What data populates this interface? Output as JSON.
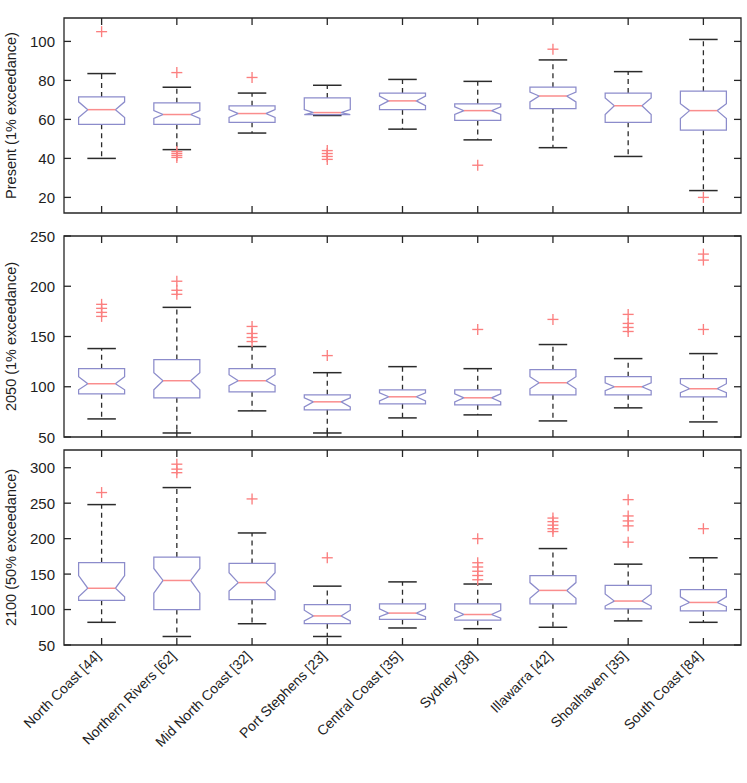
{
  "figure": {
    "title": "",
    "background": "#ffffff",
    "box_edge_color": "#8c8ccb",
    "median_color": "#fa8d8d",
    "whisker_color": "#2b2b2b",
    "outlier_color": "#fb7f7f"
  },
  "xaxis": {
    "categories": [
      "North Coast [44]",
      "Northern Rivers [62]",
      "Mid North Coast [32]",
      "Port Stephens [23]",
      "Central Coast [35]",
      "Sydney [38]",
      "Illawarra [42]",
      "Shoalhaven [35]",
      "South Coast [84]"
    ],
    "label_rotation": -45
  },
  "chart_data": [
    {
      "type": "box",
      "panel": 1,
      "title": "",
      "ylabel": "Present (1% exceedance)",
      "xlabel": "",
      "ylim": [
        12,
        112
      ],
      "yticks": [
        20,
        40,
        60,
        80,
        100
      ],
      "ytick_labels": [
        "20",
        "40",
        "60",
        "80",
        "100"
      ],
      "grid": false,
      "categories": [
        "North Coast [44]",
        "Northern Rivers [62]",
        "Mid North Coast [32]",
        "Port Stephens [23]",
        "Central Coast [35]",
        "Sydney [38]",
        "Illawarra [42]",
        "Shoalhaven [35]",
        "South Coast [84]"
      ],
      "boxes": [
        {
          "category": "North Coast [44]",
          "whisker_low": 40.0,
          "q1": 57.5,
          "median": 65.0,
          "q3": 71.5,
          "whisker_high": 83.5,
          "notch_low": 61.0,
          "notch_high": 69.0,
          "outliers": [
            105.0
          ]
        },
        {
          "category": "Northern Rivers [62]",
          "whisker_low": 44.5,
          "q1": 57.5,
          "median": 62.5,
          "q3": 68.5,
          "whisker_high": 76.5,
          "notch_low": 60.5,
          "notch_high": 64.5,
          "outliers": [
            84.0,
            43.5,
            42.5,
            41.5,
            40.5
          ]
        },
        {
          "category": "Mid North Coast [32]",
          "whisker_low": 53.0,
          "q1": 58.5,
          "median": 63.0,
          "q3": 67.0,
          "whisker_high": 73.5,
          "notch_low": 61.0,
          "notch_high": 65.0,
          "outliers": [
            81.5
          ]
        },
        {
          "category": "Port Stephens [23]",
          "whisker_low": 62.0,
          "q1": 62.5,
          "median": 63.5,
          "q3": 71.0,
          "whisker_high": 77.5,
          "notch_low": 62.5,
          "notch_high": 65.0,
          "outliers": [
            44.0,
            42.5,
            41.0,
            39.5
          ]
        },
        {
          "category": "Central Coast [35]",
          "whisker_low": 55.0,
          "q1": 65.0,
          "median": 69.5,
          "q3": 73.5,
          "whisker_high": 80.5,
          "notch_low": 67.0,
          "notch_high": 72.0,
          "outliers": []
        },
        {
          "category": "Sydney [38]",
          "whisker_low": 49.5,
          "q1": 59.5,
          "median": 64.5,
          "q3": 68.0,
          "whisker_high": 79.5,
          "notch_low": 62.5,
          "notch_high": 66.5,
          "outliers": [
            36.5
          ]
        },
        {
          "category": "Illawarra [42]",
          "whisker_low": 45.5,
          "q1": 65.5,
          "median": 72.0,
          "q3": 76.5,
          "whisker_high": 90.5,
          "notch_low": 69.0,
          "notch_high": 74.0,
          "outliers": [
            96.0
          ]
        },
        {
          "category": "Shoalhaven [35]",
          "whisker_low": 41.0,
          "q1": 58.5,
          "median": 67.0,
          "q3": 73.5,
          "whisker_high": 84.5,
          "notch_low": 62.5,
          "notch_high": 71.0,
          "outliers": []
        },
        {
          "category": "South Coast [84]",
          "whisker_low": 23.5,
          "q1": 54.5,
          "median": 64.5,
          "q3": 74.5,
          "whisker_high": 101.0,
          "notch_low": 60.5,
          "notch_high": 68.0,
          "outliers": [
            20.0
          ]
        }
      ]
    },
    {
      "type": "box",
      "panel": 2,
      "title": "",
      "ylabel": "2050 (1% exceedance)",
      "xlabel": "",
      "ylim": [
        50,
        250
      ],
      "yticks": [
        50,
        100,
        150,
        200,
        250
      ],
      "ytick_labels": [
        "50",
        "100",
        "150",
        "200",
        "250"
      ],
      "grid": false,
      "categories": [
        "North Coast [44]",
        "Northern Rivers [62]",
        "Mid North Coast [32]",
        "Port Stephens [23]",
        "Central Coast [35]",
        "Sydney [38]",
        "Illawarra [42]",
        "Shoalhaven [35]",
        "South Coast [84]"
      ],
      "boxes": [
        {
          "category": "North Coast [44]",
          "whisker_low": 68.0,
          "q1": 93.0,
          "median": 103.0,
          "q3": 118.0,
          "whisker_high": 138.0,
          "notch_low": 97.0,
          "notch_high": 110.0,
          "outliers": [
            182.0,
            178.0,
            174.0,
            170.0
          ]
        },
        {
          "category": "Northern Rivers [62]",
          "whisker_low": 54.0,
          "q1": 89.0,
          "median": 106.0,
          "q3": 127.0,
          "whisker_high": 179.0,
          "notch_low": 97.0,
          "notch_high": 114.0,
          "outliers": [
            205.0,
            196.0,
            192.0
          ]
        },
        {
          "category": "Mid North Coast [32]",
          "whisker_low": 76.0,
          "q1": 95.0,
          "median": 106.0,
          "q3": 118.0,
          "whisker_high": 140.0,
          "notch_low": 101.0,
          "notch_high": 112.0,
          "outliers": [
            160.0,
            153.0,
            149.0,
            145.0
          ]
        },
        {
          "category": "Port Stephens [23]",
          "whisker_low": 54.0,
          "q1": 77.0,
          "median": 85.0,
          "q3": 92.0,
          "whisker_high": 114.0,
          "notch_low": 80.0,
          "notch_high": 89.0,
          "outliers": [
            131.0
          ]
        },
        {
          "category": "Central Coast [35]",
          "whisker_low": 69.0,
          "q1": 83.0,
          "median": 90.0,
          "q3": 97.0,
          "whisker_high": 120.0,
          "notch_low": 86.0,
          "notch_high": 94.0,
          "outliers": []
        },
        {
          "category": "Sydney [38]",
          "whisker_low": 72.0,
          "q1": 82.0,
          "median": 89.0,
          "q3": 97.0,
          "whisker_high": 118.0,
          "notch_low": 85.0,
          "notch_high": 93.0,
          "outliers": [
            157.0
          ]
        },
        {
          "category": "Illawarra [42]",
          "whisker_low": 66.0,
          "q1": 92.0,
          "median": 104.0,
          "q3": 117.0,
          "whisker_high": 142.0,
          "notch_low": 98.0,
          "notch_high": 110.0,
          "outliers": [
            167.0
          ]
        },
        {
          "category": "Shoalhaven [35]",
          "whisker_low": 79.0,
          "q1": 92.0,
          "median": 100.0,
          "q3": 110.0,
          "whisker_high": 128.0,
          "notch_low": 96.0,
          "notch_high": 104.0,
          "outliers": [
            172.0,
            163.0,
            159.0,
            155.0
          ]
        },
        {
          "category": "South Coast [84]",
          "whisker_low": 65.0,
          "q1": 90.0,
          "median": 98.0,
          "q3": 108.0,
          "whisker_high": 133.0,
          "notch_low": 94.0,
          "notch_high": 103.0,
          "outliers": [
            232.0,
            226.0,
            157.0
          ]
        }
      ]
    },
    {
      "type": "box",
      "panel": 3,
      "title": "",
      "ylabel": "2100 (50% exceedance)",
      "xlabel": "",
      "ylim": [
        50,
        325
      ],
      "yticks": [
        50,
        100,
        150,
        200,
        250,
        300
      ],
      "ytick_labels": [
        "50",
        "100",
        "150",
        "200",
        "250",
        "300"
      ],
      "grid": false,
      "categories": [
        "North Coast [44]",
        "Northern Rivers [62]",
        "Mid North Coast [32]",
        "Port Stephens [23]",
        "Central Coast [35]",
        "Sydney [38]",
        "Illawarra [42]",
        "Shoalhaven [35]",
        "South Coast [84]"
      ],
      "boxes": [
        {
          "category": "North Coast [44]",
          "whisker_low": 82.0,
          "q1": 113.0,
          "median": 130.0,
          "q3": 166.0,
          "whisker_high": 248.0,
          "notch_low": 118.0,
          "notch_high": 148.0,
          "outliers": [
            265.0
          ]
        },
        {
          "category": "Northern Rivers [62]",
          "whisker_low": 62.0,
          "q1": 100.0,
          "median": 141.0,
          "q3": 174.0,
          "whisker_high": 272.0,
          "notch_low": 123.0,
          "notch_high": 158.0,
          "outliers": [
            305.0,
            298.0,
            293.0
          ]
        },
        {
          "category": "Mid North Coast [32]",
          "whisker_low": 80.0,
          "q1": 114.0,
          "median": 138.0,
          "q3": 165.0,
          "whisker_high": 208.0,
          "notch_low": 126.0,
          "notch_high": 152.0,
          "outliers": [
            256.0
          ]
        },
        {
          "category": "Port Stephens [23]",
          "whisker_low": 62.0,
          "q1": 80.0,
          "median": 91.0,
          "q3": 107.0,
          "whisker_high": 133.0,
          "notch_low": 84.0,
          "notch_high": 99.0,
          "outliers": [
            173.0
          ]
        },
        {
          "category": "Central Coast [35]",
          "whisker_low": 74.0,
          "q1": 86.0,
          "median": 95.0,
          "q3": 108.0,
          "whisker_high": 139.0,
          "notch_low": 90.0,
          "notch_high": 101.0,
          "outliers": []
        },
        {
          "category": "Sydney [38]",
          "whisker_low": 73.0,
          "q1": 85.0,
          "median": 93.0,
          "q3": 108.0,
          "whisker_high": 136.0,
          "notch_low": 88.0,
          "notch_high": 99.0,
          "outliers": [
            200.0,
            166.0,
            160.0,
            154.0,
            148.0,
            142.0
          ]
        },
        {
          "category": "Illawarra [42]",
          "whisker_low": 75.0,
          "q1": 108.0,
          "median": 127.0,
          "q3": 148.0,
          "whisker_high": 186.0,
          "notch_low": 116.0,
          "notch_high": 138.0,
          "outliers": [
            229.0,
            224.0,
            219.0,
            214.0,
            210.0
          ]
        },
        {
          "category": "Shoalhaven [35]",
          "whisker_low": 84.0,
          "q1": 101.0,
          "median": 112.0,
          "q3": 134.0,
          "whisker_high": 164.0,
          "notch_low": 105.0,
          "notch_high": 122.0,
          "outliers": [
            255.0,
            232.0,
            225.0,
            218.0,
            195.0
          ]
        },
        {
          "category": "South Coast [84]",
          "whisker_low": 82.0,
          "q1": 98.0,
          "median": 110.0,
          "q3": 128.0,
          "whisker_high": 173.0,
          "notch_low": 104.0,
          "notch_high": 118.0,
          "outliers": [
            214.0
          ]
        }
      ]
    }
  ]
}
